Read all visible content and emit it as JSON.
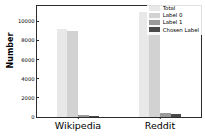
{
  "chart_data": {
    "type": "bar",
    "title": "",
    "xlabel": "",
    "ylabel": "Number",
    "categories": [
      "Wikipedia",
      "Reddit"
    ],
    "ylim": [
      0,
      11600
    ],
    "yticks": [
      0,
      2000,
      4000,
      6000,
      8000,
      10000
    ],
    "ytick_labels": [
      "0",
      "2000",
      "4000",
      "6000",
      "8000",
      "10000"
    ],
    "grid": false,
    "legend_position": "upper right",
    "series": [
      {
        "name": "Total",
        "color": "#e8e8e8",
        "values": [
          9200,
          11000
        ]
      },
      {
        "name": "Label 0",
        "color": "#d2d2d2",
        "values": [
          9000,
          10600
        ]
      },
      {
        "name": "Label 1",
        "color": "#9a9a9a",
        "values": [
          200,
          400
        ]
      },
      {
        "name": "Chosen Label",
        "color": "#4a4a4a",
        "values": [
          150,
          300
        ]
      }
    ]
  },
  "figure": {
    "axis_color": "#2b2b2b",
    "background": "#ffffff"
  }
}
